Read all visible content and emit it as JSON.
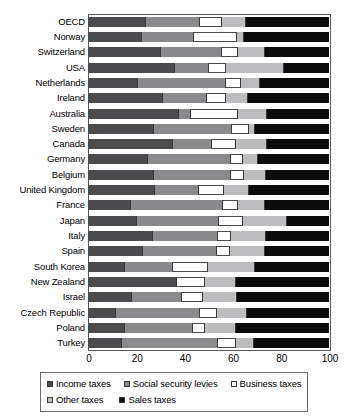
{
  "chart_data": {
    "type": "bar",
    "subtype": "horizontal-stacked-100",
    "title": "",
    "xlabel": "",
    "ylabel": "",
    "xlim": [
      0,
      100
    ],
    "xticks": [
      "0",
      "20",
      "40",
      "60",
      "80",
      "100"
    ],
    "grid": false,
    "legend_position": "bottom",
    "categories": [
      "OECD",
      "Norway",
      "Switzerland",
      "USA",
      "Netherlands",
      "Ireland",
      "Australia",
      "Sweden",
      "Canada",
      "Germany",
      "Belgium",
      "United Kingdom",
      "France",
      "Japan",
      "Italy",
      "Spain",
      "South Korea",
      "New Zealand",
      "Israel",
      "Czech Republic",
      "Poland",
      "Turkey"
    ],
    "series": [
      {
        "name": "Income taxes",
        "color": "#4b4b4d",
        "values": [
          23.5,
          22.0,
          30.0,
          35.5,
          20.5,
          30.5,
          37.5,
          27.0,
          35.0,
          24.5,
          27.0,
          27.5,
          17.5,
          20.0,
          26.5,
          22.5,
          15.0,
          36.5,
          18.0,
          11.0,
          15.0,
          13.5
        ]
      },
      {
        "name": "Social security levies",
        "color": "#8a8a8c",
        "values": [
          22.5,
          21.5,
          25.0,
          14.5,
          36.5,
          18.5,
          5.0,
          32.5,
          16.0,
          34.5,
          32.0,
          18.0,
          38.0,
          34.0,
          27.0,
          30.5,
          20.0,
          0.0,
          20.5,
          35.0,
          28.0,
          40.0
        ]
      },
      {
        "name": "Business taxes",
        "color": "#ffffff",
        "values": [
          9.0,
          18.0,
          7.0,
          7.0,
          6.0,
          8.0,
          19.5,
          7.0,
          10.0,
          5.0,
          5.5,
          10.5,
          6.5,
          10.0,
          5.5,
          5.5,
          14.5,
          11.5,
          9.0,
          7.0,
          5.0,
          7.5
        ]
      },
      {
        "name": "Other taxes",
        "color": "#bdbdbf",
        "values": [
          10.0,
          3.0,
          11.0,
          24.0,
          8.0,
          9.0,
          12.0,
          2.5,
          13.0,
          6.0,
          9.0,
          10.5,
          11.0,
          18.0,
          14.5,
          14.5,
          19.5,
          13.0,
          14.0,
          12.5,
          13.0,
          7.5
        ]
      },
      {
        "name": "Sales taxes",
        "color": "#0b0b0b",
        "values": [
          35.0,
          35.5,
          27.0,
          19.0,
          29.0,
          34.0,
          26.0,
          31.0,
          26.0,
          30.0,
          26.5,
          33.5,
          27.0,
          18.0,
          26.5,
          27.0,
          31.0,
          39.0,
          38.5,
          34.5,
          39.0,
          31.5
        ]
      }
    ]
  },
  "axis": {
    "ticks": [
      {
        "label": "0",
        "value": 0
      },
      {
        "label": "20",
        "value": 20
      },
      {
        "label": "40",
        "value": 40
      },
      {
        "label": "60",
        "value": 60
      },
      {
        "label": "80",
        "value": 80
      },
      {
        "label": "100",
        "value": 100
      }
    ]
  },
  "legend": {
    "row1": [
      {
        "label": "Income taxes",
        "swatch": "sw-income",
        "name": "legend-swatch-income-taxes"
      },
      {
        "label": "Social security levies",
        "swatch": "sw-social",
        "name": "legend-swatch-social-security-levies"
      },
      {
        "label": "Business taxes",
        "swatch": "sw-business",
        "name": "legend-swatch-business-taxes"
      }
    ],
    "row2": [
      {
        "label": "Other taxes",
        "swatch": "sw-other",
        "name": "legend-swatch-other-taxes"
      },
      {
        "label": "Sales taxes",
        "swatch": "sw-sales",
        "name": "legend-swatch-sales-taxes"
      }
    ]
  }
}
